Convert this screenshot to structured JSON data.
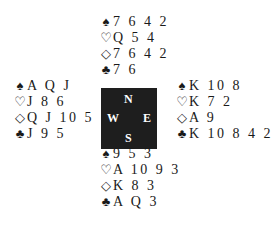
{
  "compass": {
    "north": "N",
    "east": "E",
    "south": "S",
    "west": "W"
  },
  "symbols": {
    "spades": "♠",
    "hearts": "♡",
    "diamonds": "◇",
    "clubs": "♣"
  },
  "hands": {
    "north": {
      "spades": "7 6 4 2",
      "hearts": "Q 5 4",
      "diamonds": "7 6 4 2",
      "clubs": "7 6"
    },
    "west": {
      "spades": "A Q J",
      "hearts": "J 8 6",
      "diamonds": "Q J 10 5",
      "clubs": "J 9 5"
    },
    "east": {
      "spades": "K 10 8",
      "hearts": "K 7 2",
      "diamonds": "A 9",
      "clubs": "K 10 8 4 2"
    },
    "south": {
      "spades": "9 5 3",
      "hearts": "A 10 9 3",
      "diamonds": "K 8 3",
      "clubs": "A Q 3"
    }
  }
}
